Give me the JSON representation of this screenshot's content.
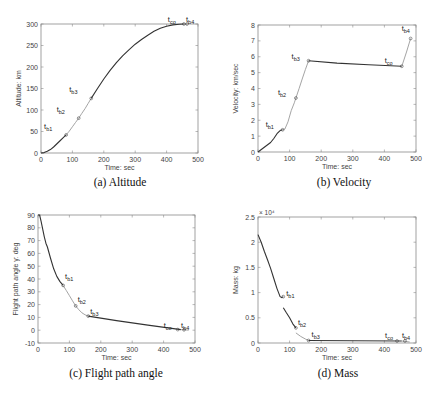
{
  "figure": {
    "colors": {
      "axis": "#8a8a8a",
      "line_dark": "#333333",
      "line_light": "#9a9a9a",
      "text": "#444444",
      "caption": "#111111"
    }
  },
  "chart_data": [
    {
      "id": "a",
      "type": "line",
      "caption": "(a)  Altitude",
      "title": "",
      "xlabel": "Time: sec",
      "ylabel": "Altitude: km",
      "xlim": [
        0,
        500
      ],
      "ylim": [
        0,
        300
      ],
      "xticks": [
        0,
        100,
        200,
        300,
        400,
        500
      ],
      "yticks": [
        0,
        50,
        100,
        150,
        200,
        250,
        300
      ],
      "box": {
        "left": 41,
        "top": 24,
        "right": 198,
        "bottom": 153
      },
      "caption_pos": {
        "x": 120,
        "y": 176
      },
      "series": [
        {
          "name": "stage1",
          "style": "dark",
          "x": [
            0,
            10,
            20,
            30,
            40,
            50,
            60,
            70,
            80
          ],
          "y": [
            0,
            1,
            4,
            8,
            14,
            21,
            28,
            35,
            42
          ]
        },
        {
          "name": "stage2",
          "style": "light",
          "x": [
            80,
            90,
            100,
            110,
            120
          ],
          "y": [
            42,
            51,
            61,
            71,
            81
          ]
        },
        {
          "name": "stage3",
          "style": "light",
          "x": [
            120,
            130,
            140,
            150,
            160
          ],
          "y": [
            81,
            92,
            103,
            115,
            127
          ]
        },
        {
          "name": "stage4",
          "style": "dark",
          "x": [
            160,
            180,
            200,
            220,
            240,
            260,
            280,
            300,
            320,
            340,
            360,
            380,
            400,
            420,
            440,
            455
          ],
          "y": [
            127,
            150,
            172,
            192,
            210,
            226,
            240,
            253,
            264,
            274,
            283,
            290,
            295,
            298,
            299.5,
            300
          ]
        },
        {
          "name": "stage5",
          "style": "light",
          "x": [
            455,
            465
          ],
          "y": [
            300,
            300
          ]
        }
      ],
      "markers": [
        {
          "label": "t",
          "sub": "b1",
          "x": 80,
          "y": 42,
          "lx": -22,
          "ly": -6
        },
        {
          "label": "t",
          "sub": "b2",
          "x": 120,
          "y": 81,
          "lx": -22,
          "ly": -6
        },
        {
          "label": "t",
          "sub": "b3",
          "x": 160,
          "y": 127,
          "lx": -22,
          "ly": -6
        },
        {
          "label": "t",
          "sub": "co",
          "x": 455,
          "y": 300,
          "lx": -16,
          "ly": -2
        },
        {
          "label": "t",
          "sub": "b4",
          "x": 465,
          "y": 300,
          "lx": -1,
          "ly": -2
        }
      ]
    },
    {
      "id": "b",
      "type": "line",
      "caption": "(b)  Velocity",
      "title": "",
      "xlabel": "Time: sec",
      "ylabel": "Velocity: km/sec",
      "xlim": [
        0,
        500
      ],
      "ylim": [
        0,
        8
      ],
      "xticks": [
        0,
        100,
        200,
        300,
        400,
        500
      ],
      "yticks": [
        0,
        1,
        2,
        3,
        4,
        5,
        6,
        7,
        8
      ],
      "box": {
        "left": 258,
        "top": 25,
        "right": 416,
        "bottom": 152
      },
      "caption_pos": {
        "x": 344,
        "y": 176
      },
      "series": [
        {
          "name": "stage1",
          "style": "dark",
          "x": [
            0,
            20,
            40,
            50,
            60,
            70,
            78
          ],
          "y": [
            0,
            0.3,
            0.6,
            0.85,
            1.15,
            1.35,
            1.4
          ]
        },
        {
          "name": "stage2",
          "style": "light",
          "x": [
            78,
            85,
            95,
            105,
            115,
            120
          ],
          "y": [
            1.4,
            1.45,
            1.9,
            2.6,
            3.1,
            3.4
          ]
        },
        {
          "name": "stage3",
          "style": "light",
          "x": [
            120,
            130,
            140,
            150,
            160
          ],
          "y": [
            3.4,
            4.0,
            4.6,
            5.2,
            5.75
          ]
        },
        {
          "name": "stage4",
          "style": "dark",
          "x": [
            160,
            250,
            350,
            455
          ],
          "y": [
            5.75,
            5.6,
            5.5,
            5.4
          ]
        },
        {
          "name": "stage5",
          "style": "light",
          "x": [
            455,
            470,
            483
          ],
          "y": [
            5.4,
            6.3,
            7.15
          ]
        }
      ],
      "markers": [
        {
          "label": "t",
          "sub": "b1",
          "x": 78,
          "y": 1.4,
          "lx": -17,
          "ly": -3
        },
        {
          "label": "t",
          "sub": "b2",
          "x": 120,
          "y": 3.4,
          "lx": -18,
          "ly": -3
        },
        {
          "label": "t",
          "sub": "b3",
          "x": 160,
          "y": 5.75,
          "lx": -17,
          "ly": -2
        },
        {
          "label": "t",
          "sub": "co",
          "x": 455,
          "y": 5.4,
          "lx": -17,
          "ly": -3
        },
        {
          "label": "t",
          "sub": "b4",
          "x": 483,
          "y": 7.15,
          "lx": -9,
          "ly": -7
        }
      ]
    },
    {
      "id": "c",
      "type": "line",
      "caption": "(c)  Flight path angle",
      "title": "",
      "xlabel": "Time: sec",
      "ylabel": "Flight path angle γ: deg",
      "xlim": [
        0,
        500
      ],
      "ylim": [
        -10,
        90
      ],
      "xticks": [
        0,
        100,
        200,
        300,
        400,
        500
      ],
      "yticks": [
        -10,
        0,
        10,
        20,
        30,
        40,
        50,
        60,
        70,
        80,
        90
      ],
      "box": {
        "left": 38,
        "top": 215,
        "right": 195,
        "bottom": 343
      },
      "caption_pos": {
        "x": 116,
        "y": 367
      },
      "series": [
        {
          "name": "stage1",
          "style": "dark",
          "x": [
            0,
            5,
            10,
            15,
            20,
            25,
            30,
            40,
            50,
            60,
            70,
            80
          ],
          "y": [
            90,
            90,
            85,
            79,
            73,
            68,
            65,
            56,
            48,
            42,
            38,
            35
          ]
        },
        {
          "name": "stage2",
          "style": "light",
          "x": [
            80,
            90,
            100,
            110,
            120
          ],
          "y": [
            35,
            31,
            27,
            23,
            19
          ]
        },
        {
          "name": "stage3",
          "style": "light",
          "x": [
            120,
            130,
            140,
            150,
            160
          ],
          "y": [
            19,
            16,
            13.5,
            12,
            11
          ]
        },
        {
          "name": "stage4",
          "style": "dark",
          "x": [
            160,
            250,
            350,
            455
          ],
          "y": [
            11,
            7.5,
            4,
            0.5
          ]
        },
        {
          "name": "stage5",
          "style": "light",
          "x": [
            455,
            465,
            480
          ],
          "y": [
            0.5,
            0.3,
            0
          ]
        }
      ],
      "markers": [
        {
          "label": "t",
          "sub": "b1",
          "x": 80,
          "y": 35,
          "lx": 2,
          "ly": -6
        },
        {
          "label": "t",
          "sub": "b2",
          "x": 120,
          "y": 19,
          "lx": 2,
          "ly": -4
        },
        {
          "label": "t",
          "sub": "b3",
          "x": 160,
          "y": 11,
          "lx": 2,
          "ly": -2
        },
        {
          "label": "t",
          "sub": "co",
          "x": 445,
          "y": 0.5,
          "lx": -14,
          "ly": -2
        },
        {
          "label": "t",
          "sub": "b4",
          "x": 465,
          "y": 0.3,
          "lx": -3,
          "ly": -2
        }
      ]
    },
    {
      "id": "d",
      "type": "line",
      "caption": "(d)  Mass",
      "title": "",
      "xlabel": "Time: sec",
      "ylabel": "Mass: kg",
      "y_exponent": "× 10⁴",
      "xlim": [
        0,
        500
      ],
      "ylim": [
        0,
        2.5
      ],
      "xticks": [
        0,
        100,
        200,
        300,
        400,
        500
      ],
      "yticks": [
        0,
        0.5,
        1,
        1.5,
        2,
        2.5
      ],
      "ytick_labels": [
        "0",
        "0.5",
        "1",
        "1.5",
        "2",
        "2.5"
      ],
      "box": {
        "left": 258,
        "top": 217,
        "right": 416,
        "bottom": 343
      },
      "caption_pos": {
        "x": 338,
        "y": 367
      },
      "series": [
        {
          "name": "stage1",
          "style": "dark",
          "x": [
            0,
            10,
            20,
            30,
            40,
            50,
            60,
            70,
            75,
            80
          ],
          "y": [
            2.15,
            2.0,
            1.82,
            1.65,
            1.48,
            1.28,
            1.08,
            0.92,
            0.9,
            0.92
          ]
        },
        {
          "name": "stage2",
          "style": "dark",
          "x": [
            80,
            90,
            100,
            110,
            120
          ],
          "y": [
            0.7,
            0.6,
            0.5,
            0.38,
            0.3
          ]
        },
        {
          "name": "stage3",
          "style": "light",
          "x": [
            120,
            135,
            150,
            160
          ],
          "y": [
            0.2,
            0.13,
            0.08,
            0.05
          ]
        },
        {
          "name": "stage4",
          "style": "dark",
          "x": [
            160,
            300,
            455
          ],
          "y": [
            0.05,
            0.045,
            0.04
          ]
        },
        {
          "name": "stage5",
          "style": "light",
          "x": [
            455,
            480
          ],
          "y": [
            0.04,
            0.02
          ]
        }
      ],
      "markers": [
        {
          "label": "t",
          "sub": "b1",
          "x": 80,
          "y": 0.92,
          "lx": 3,
          "ly": -1
        },
        {
          "label": "t",
          "sub": "b2",
          "x": 120,
          "y": 0.3,
          "lx": 2,
          "ly": -3
        },
        {
          "label": "t",
          "sub": "b3",
          "x": 160,
          "y": 0.05,
          "lx": 3,
          "ly": -3
        },
        {
          "label": "t",
          "sub": "co",
          "x": 440,
          "y": 0.04,
          "lx": -12,
          "ly": -3
        },
        {
          "label": "t",
          "sub": "b4",
          "x": 465,
          "y": 0.04,
          "lx": -3,
          "ly": -3
        }
      ]
    }
  ]
}
